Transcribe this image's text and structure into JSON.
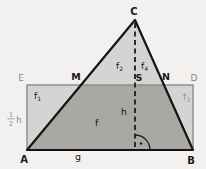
{
  "figure": {
    "labels": {
      "C": "C",
      "E": "E",
      "M": "M",
      "S": "S",
      "N": "N",
      "D": "D",
      "A": "A",
      "B": "B",
      "f_base": "f",
      "f1_sub": "1",
      "f2_sub": "2",
      "f3_sub": "3",
      "f4_sub": "4",
      "f_region": "f",
      "h": "h",
      "g": "g",
      "half_numerator": "1",
      "half_denominator": "2",
      "half_h_letter": "h"
    },
    "colors": {
      "background": "#f2f1ef",
      "region_light": "#d5d4d2",
      "region_dark": "#a9a8a5",
      "triangle_line": "#141414",
      "rectangle_line": "#8b8a88",
      "gray_label": "#8a8a88"
    }
  }
}
